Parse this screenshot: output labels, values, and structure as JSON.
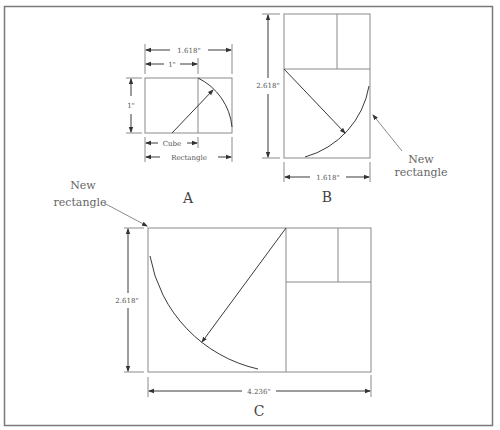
{
  "figure": {
    "panel_a": {
      "label": "A",
      "width_label": "1.618\"",
      "cube_width_label": "1\"",
      "height_label": "1\"",
      "cube_label": "Cube",
      "rectangle_label": "Rectangle"
    },
    "panel_b": {
      "label": "B",
      "height_label": "2.618\"",
      "width_label": "1.618\"",
      "note_line1": "New",
      "note_line2": "rectangle"
    },
    "panel_c": {
      "label": "C",
      "height_label": "2.618\"",
      "width_label": "4.236\"",
      "note_line1": "New",
      "note_line2": "rectangle"
    }
  }
}
